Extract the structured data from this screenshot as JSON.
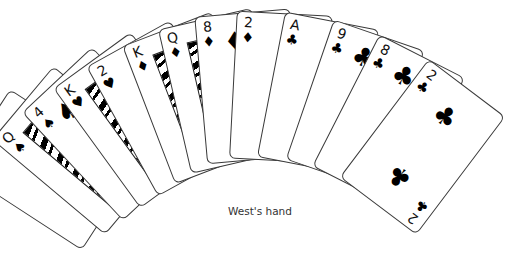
{
  "caption": "West's hand",
  "cards": [
    {
      "rank": "A",
      "suit": "♠",
      "suit_name": "spades"
    },
    {
      "rank": "Q",
      "suit": "♠",
      "suit_name": "spades"
    },
    {
      "rank": "4",
      "suit": "♠",
      "suit_name": "spades"
    },
    {
      "rank": "K",
      "suit": "♥",
      "suit_name": "hearts"
    },
    {
      "rank": "2",
      "suit": "♥",
      "suit_name": "hearts"
    },
    {
      "rank": "K",
      "suit": "♦",
      "suit_name": "diamonds"
    },
    {
      "rank": "Q",
      "suit": "♦",
      "suit_name": "diamonds"
    },
    {
      "rank": "8",
      "suit": "♦",
      "suit_name": "diamonds"
    },
    {
      "rank": "2",
      "suit": "♦",
      "suit_name": "diamonds"
    },
    {
      "rank": "A",
      "suit": "♣",
      "suit_name": "clubs"
    },
    {
      "rank": "9",
      "suit": "♣",
      "suit_name": "clubs"
    },
    {
      "rank": "8",
      "suit": "♣",
      "suit_name": "clubs"
    },
    {
      "rank": "2",
      "suit": "♣",
      "suit_name": "clubs"
    }
  ],
  "colors": {
    "card_border": "#3a3a3a",
    "suit": "#000000",
    "caption": "#333333"
  }
}
